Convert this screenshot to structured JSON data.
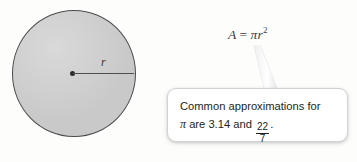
{
  "figure": {
    "background_color": "#fdfdfc"
  },
  "circle": {
    "name": "shaded circle",
    "fill_color": "#c9c9c9",
    "stroke_color": "#4a4a4a",
    "center_dot_color": "#2b2b2b",
    "radius_label": "r",
    "radius_line_color": "#4f4f4f"
  },
  "formula": {
    "area_variable": "A",
    "equals": "=",
    "pi": "π",
    "radius_variable": "r",
    "exponent": "2",
    "full_text": "A = πr²"
  },
  "callout": {
    "line1": "Common approximations for",
    "line2_prefix": "are 3.14 and",
    "pi_symbol": "π",
    "fraction_numerator": "22",
    "fraction_denominator": "7",
    "trailing_period": ".",
    "full_text": "Common approximations for π are 3.14 and 22/7.",
    "border_color": "#d2d2d2",
    "background_color": "#ffffff"
  }
}
